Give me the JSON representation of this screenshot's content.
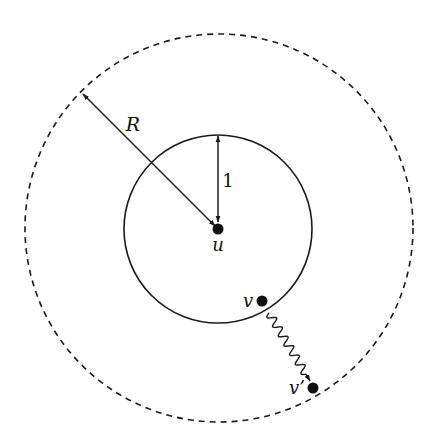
{
  "diagram": {
    "colors": {
      "background": "#ffffff",
      "stroke": "#1a1a1a",
      "dot": "#111111"
    },
    "outer_circle": {
      "cx": 219,
      "cy": 228,
      "r": 194,
      "style": "dashed"
    },
    "inner_circle": {
      "cx": 218,
      "cy": 229,
      "r": 94,
      "style": "solid"
    },
    "nodes": [
      {
        "id": "u",
        "label": "u",
        "x": 218,
        "y": 229,
        "label_x": 218,
        "label_y": 245
      },
      {
        "id": "v",
        "label": "v",
        "x": 262,
        "y": 301,
        "label_x": 248,
        "label_y": 301
      },
      {
        "id": "v_prime",
        "label": "v’",
        "x": 313,
        "y": 388,
        "label_x": 297,
        "label_y": 388
      }
    ],
    "arrows": [
      {
        "id": "radius-R",
        "label": "R",
        "from": [
          83,
          94
        ],
        "to": [
          215,
          226
        ],
        "double": true,
        "label_x": 133,
        "label_y": 124
      },
      {
        "id": "radius-1",
        "label": "1",
        "from": [
          218,
          136
        ],
        "to": [
          218,
          222
        ],
        "double": true,
        "label_x": 228,
        "label_y": 181
      },
      {
        "id": "move-v-to-v-prime",
        "label": "",
        "from": [
          269,
          313
        ],
        "to": [
          310,
          381
        ],
        "wavy": true
      }
    ]
  }
}
